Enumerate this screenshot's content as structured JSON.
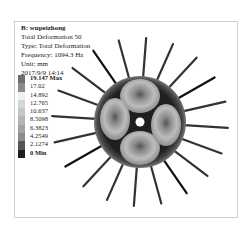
{
  "info": {
    "title": "B: wupeizhong",
    "lines": [
      "Total Deformation 50",
      "Type: Total Deformation",
      "Frequency: 1094.3 Hz",
      "Unit: mm",
      "2017/9/9 14:14"
    ]
  },
  "legend": [
    {
      "label": "19.147 Max",
      "color": "#6f6f6f",
      "bold": true
    },
    {
      "label": "17.02",
      "color": "#8a8a8a"
    },
    {
      "label": "14.892",
      "color": "#f0f0f0"
    },
    {
      "label": "12.765",
      "color": "#d6d6d6"
    },
    {
      "label": "10.637",
      "color": "#c6c6c6"
    },
    {
      "label": "8.5098",
      "color": "#b4b4b4"
    },
    {
      "label": "6.3823",
      "color": "#a2a2a2"
    },
    {
      "label": "4.2549",
      "color": "#8c8c8c"
    },
    {
      "label": "2.1274",
      "color": "#555555"
    },
    {
      "label": "0 Min",
      "color": "#1e1e1e",
      "bold": true
    }
  ]
}
